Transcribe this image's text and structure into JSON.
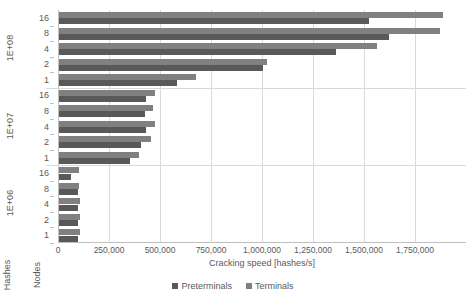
{
  "chart_data": {
    "type": "bar",
    "orientation": "horizontal",
    "title": "",
    "xlabel": "Cracking speed [hashes/s]",
    "ylabel": "Nodes",
    "y_outer_label": "Hashes",
    "xlim": [
      0,
      2000000
    ],
    "xticks": [
      0,
      250000,
      500000,
      750000,
      1000000,
      1250000,
      1500000,
      1750000
    ],
    "xtick_labels": [
      "0",
      "250,000",
      "500,000",
      "750,000",
      "1,000,000",
      "1,250,000",
      "1,500,000",
      "1,750,000"
    ],
    "grid": true,
    "legend_position": "bottom",
    "legend": [
      "Preterminals",
      "Terminals"
    ],
    "colors": {
      "preterminals": "#595959",
      "terminals": "#808080",
      "gridline": "#d9d9d9",
      "axis": "#bfbfbf",
      "text": "#595959",
      "background": "#ffffff"
    },
    "groups": [
      {
        "label": "1E+08",
        "categories": [
          "16",
          "8",
          "4",
          "2",
          "1"
        ],
        "series": [
          {
            "name": "Preterminals",
            "values": [
              1520000,
              1620000,
              1360000,
              1000000,
              580000
            ]
          },
          {
            "name": "Terminals",
            "values": [
              1880000,
              1870000,
              1560000,
              1020000,
              670000
            ]
          }
        ]
      },
      {
        "label": "1E+07",
        "categories": [
          "16",
          "8",
          "4",
          "2",
          "1"
        ],
        "series": [
          {
            "name": "Preterminals",
            "values": [
              425000,
              420000,
              425000,
              400000,
              350000
            ]
          },
          {
            "name": "Terminals",
            "values": [
              470000,
              460000,
              470000,
              450000,
              390000
            ]
          }
        ]
      },
      {
        "label": "1E+06",
        "categories": [
          "16",
          "8",
          "4",
          "2",
          "1"
        ],
        "series": [
          {
            "name": "Preterminals",
            "values": [
              60000,
              95000,
              95000,
              95000,
              95000
            ]
          },
          {
            "name": "Terminals",
            "values": [
              100000,
              100000,
              105000,
              105000,
              105000
            ]
          }
        ]
      }
    ]
  },
  "axis": {
    "x_title": "Cracking speed [hashes/s]",
    "hashes_title": "Hashes",
    "nodes_title": "Nodes"
  },
  "legend": {
    "items": [
      {
        "label": "Preterminals"
      },
      {
        "label": "Terminals"
      }
    ]
  }
}
